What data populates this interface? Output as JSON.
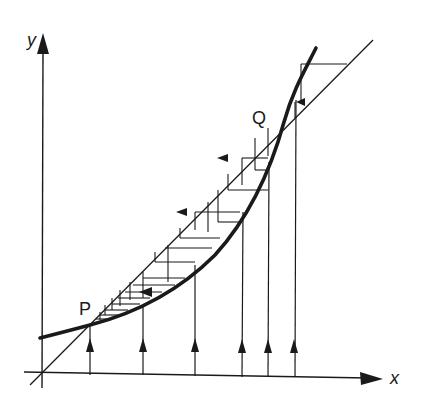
{
  "diagram": {
    "type": "cobweb-iteration-diagram",
    "axes": {
      "x_label": "x",
      "y_label": "y"
    },
    "points": [
      {
        "name": "P",
        "label": "P",
        "description": "lower fixed point (attracting)"
      },
      {
        "name": "Q",
        "label": "Q",
        "description": "upper fixed point (repelling)"
      }
    ],
    "curves": [
      {
        "name": "y = f(x)",
        "style": "thick",
        "description": "convex increasing curve"
      },
      {
        "name": "y = x",
        "style": "thin",
        "description": "diagonal line through origin"
      }
    ],
    "vertical_arrows_count": 6,
    "stroke_color": "#1a1a1a",
    "background": "#ffffff"
  }
}
